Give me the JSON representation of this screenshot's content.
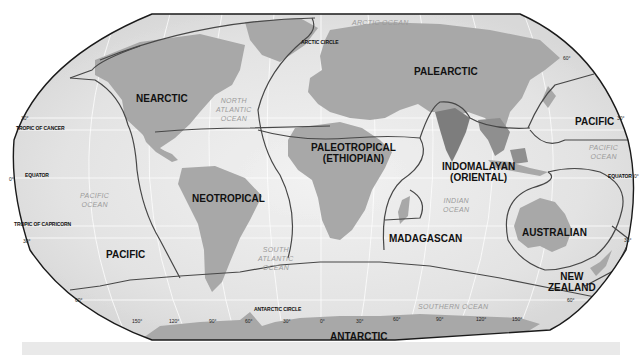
{
  "map": {
    "title": "Biogeographic Realms World Map",
    "projection": "Robinson",
    "colors": {
      "land": "#a8a8a8",
      "land_highlight": "#7f7f7f",
      "ocean": "#e2e2e2",
      "ocean_center": "#f4f4f4",
      "boundary": "#4a4a4a",
      "frame": "#222222",
      "grid": "#ffffff",
      "footer_bar": "#e9e9e9"
    },
    "realms": [
      {
        "id": "nearctic",
        "name": "NEARCTIC"
      },
      {
        "id": "palearctic",
        "name": "PALEARCTIC"
      },
      {
        "id": "neotropical",
        "name": "NEOTROPICAL"
      },
      {
        "id": "paleotropical",
        "name": "PALEOTROPICAL",
        "subname": "(ETHIOPIAN)"
      },
      {
        "id": "indomalayan",
        "name": "INDOMALAYAN",
        "subname": "(ORIENTAL)"
      },
      {
        "id": "madagascan",
        "name": "MADAGASCAN"
      },
      {
        "id": "australian",
        "name": "AUSTRALIAN"
      },
      {
        "id": "new-zealand",
        "name": "NEW",
        "subname": "ZEALAND"
      },
      {
        "id": "pacific-west",
        "name": "PACIFIC"
      },
      {
        "id": "pacific-east",
        "name": "PACIFIC"
      },
      {
        "id": "antarctic",
        "name": "ANTARCTIC"
      }
    ],
    "oceans": [
      {
        "id": "arctic-ocean",
        "name": "ARCTIC OCEAN"
      },
      {
        "id": "north-atlantic",
        "line1": "NORTH",
        "line2": "ATLANTIC",
        "line3": "OCEAN"
      },
      {
        "id": "pacific-ocean-west",
        "line1": "PACIFIC",
        "line2": "OCEAN"
      },
      {
        "id": "pacific-ocean-east",
        "line1": "PACIFIC",
        "line2": "OCEAN"
      },
      {
        "id": "south-atlantic",
        "line1": "SOUTH",
        "line2": "ATLANTIC",
        "line3": "OCEAN"
      },
      {
        "id": "indian-ocean",
        "line1": "INDIAN",
        "line2": "OCEAN"
      },
      {
        "id": "southern-ocean",
        "name": "SOUTHERN OCEAN"
      }
    ],
    "reference_lines": {
      "arctic_circle": "ARCTIC CIRCLE",
      "tropic_of_cancer": "TROPIC OF CANCER",
      "equator_left": "EQUATOR",
      "equator_right": "EQUATOR",
      "tropic_of_capricorn": "TROPIC OF CAPRICORN",
      "antarctic_circle": "ANTARCTIC CIRCLE"
    },
    "latitude_labels": {
      "left": [
        "30°",
        "0°",
        "30°",
        "60°"
      ],
      "right": [
        "60°",
        "30°",
        "0°",
        "30°",
        "60°"
      ]
    },
    "longitude_labels": [
      "150°",
      "120°",
      "90°",
      "60°",
      "30°",
      "0°",
      "30°",
      "60°",
      "90°",
      "120°",
      "150°"
    ]
  }
}
